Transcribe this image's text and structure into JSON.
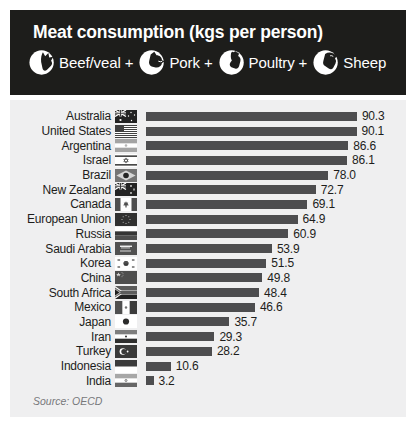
{
  "header": {
    "title": "Meat consumption (kgs per person)",
    "legend": [
      {
        "icon": "beef-icon",
        "label": "Beef/veal +"
      },
      {
        "icon": "pork-icon",
        "label": "Pork +"
      },
      {
        "icon": "poultry-icon",
        "label": "Poultry +"
      },
      {
        "icon": "sheep-icon",
        "label": "Sheep"
      }
    ]
  },
  "chart_data": {
    "type": "bar",
    "orientation": "horizontal",
    "title": "Meat consumption (kgs per person)",
    "unit": "kgs per person",
    "xlim": [
      0,
      95
    ],
    "grid": false,
    "legend_position": "header",
    "bar_color": "#4d4d4f",
    "categories": [
      "Australia",
      "United States",
      "Argentina",
      "Israel",
      "Brazil",
      "New Zealand",
      "Canada",
      "European Union",
      "Russia",
      "Saudi Arabia",
      "Korea",
      "China",
      "South Africa",
      "Mexico",
      "Japan",
      "Iran",
      "Turkey",
      "Indonesia",
      "India"
    ],
    "values": [
      90.3,
      90.1,
      86.6,
      86.1,
      78.0,
      72.7,
      69.1,
      64.9,
      60.9,
      53.9,
      51.5,
      49.8,
      48.4,
      46.6,
      35.7,
      29.3,
      28.2,
      10.6,
      3.2
    ],
    "value_labels": [
      "90.3",
      "90.1",
      "86.6",
      "86.1",
      "78.0",
      "72.7",
      "69.1",
      "64.9",
      "60.9",
      "53.9",
      "51.5",
      "49.8",
      "48.4",
      "46.6",
      "35.7",
      "29.3",
      "28.2",
      "10.6",
      "3.2"
    ],
    "flags": [
      "au-flag-icon",
      "us-flag-icon",
      "ar-flag-icon",
      "il-flag-icon",
      "br-flag-icon",
      "nz-flag-icon",
      "ca-flag-icon",
      "eu-flag-icon",
      "ru-flag-icon",
      "sa-flag-icon",
      "kr-flag-icon",
      "cn-flag-icon",
      "za-flag-icon",
      "mx-flag-icon",
      "jp-flag-icon",
      "ir-flag-icon",
      "tr-flag-icon",
      "id-flag-icon",
      "in-flag-icon"
    ]
  },
  "footer": {
    "source": "Source: OECD"
  },
  "colors": {
    "header_bg": "#1d1d1b",
    "panel_bg": "#efeff0",
    "bar": "#4d4d4f",
    "text": "#1d1d1b",
    "source_text": "#77787b",
    "header_text": "#ffffff"
  }
}
